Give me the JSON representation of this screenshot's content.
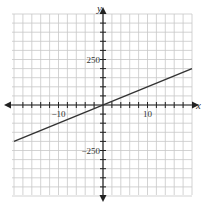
{
  "chart_data": {
    "type": "line",
    "title": "",
    "xlabel": "x",
    "ylabel": "y",
    "xlim": [
      -20,
      20
    ],
    "ylim": [
      -500,
      500
    ],
    "x_grid_step": 2,
    "y_grid_step": 50,
    "x_tick_labels": [
      {
        "value": -10,
        "label": "−10"
      },
      {
        "value": 10,
        "label": "10"
      }
    ],
    "y_tick_labels": [
      {
        "value": 250,
        "label": "250"
      },
      {
        "value": -250,
        "label": "−250"
      }
    ],
    "grid": true,
    "legend": null,
    "series": [
      {
        "name": "y = 10x",
        "x": [
          -20,
          20
        ],
        "values": [
          -200,
          200
        ]
      }
    ]
  },
  "colors": {
    "grid": "#c8c8c8",
    "axis": "#222222",
    "line": "#333333"
  }
}
